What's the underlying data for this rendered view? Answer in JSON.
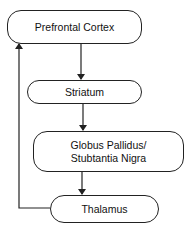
{
  "diagram": {
    "type": "flowchart",
    "nodes": [
      {
        "id": "pfc",
        "label": "Prefrontal Cortex"
      },
      {
        "id": "striatum",
        "label": "Striatum"
      },
      {
        "id": "gp_sn",
        "label": "Globus Pallidus/ Stubtantia Nigra"
      },
      {
        "id": "thalamus",
        "label": "Thalamus"
      }
    ],
    "edges": [
      {
        "from": "pfc",
        "to": "striatum"
      },
      {
        "from": "striatum",
        "to": "gp_sn"
      },
      {
        "from": "gp_sn",
        "to": "thalamus"
      },
      {
        "from": "thalamus",
        "to": "pfc"
      }
    ]
  }
}
